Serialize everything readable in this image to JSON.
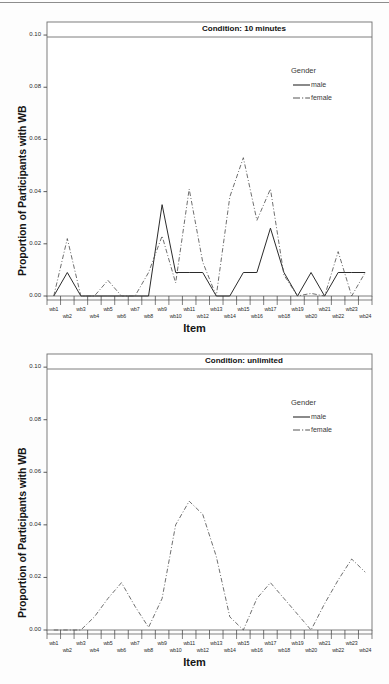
{
  "figure": {
    "ylabel": "Proportion of Participants with WB",
    "xlabel": "Item",
    "ytick_labels": [
      "0.00",
      "0.02",
      "0.04",
      "0.06",
      "0.08",
      "0.10"
    ],
    "categories": [
      "wb1",
      "wb2",
      "wb3",
      "wb4",
      "wb5",
      "wb6",
      "wb7",
      "wb8",
      "wb9",
      "wb10",
      "wb11",
      "wb12",
      "wb13",
      "wb14",
      "wb15",
      "wb16",
      "wb17",
      "wb18",
      "wb19",
      "wb20",
      "wb21",
      "wb22",
      "wb23",
      "wb24"
    ],
    "legend_title": "Gender",
    "legend_male": "male",
    "legend_female": "female",
    "male_color": "#2b2b2b",
    "female_color": "#555555",
    "frame_color": "#6f6f6f"
  },
  "chart_data": [
    {
      "type": "line",
      "title": "Condition: 10 minutes",
      "xlabel": "Item",
      "ylabel": "Proportion of Participants with WB",
      "ylim": [
        0.0,
        0.105
      ],
      "yticks": [
        0.0,
        0.02,
        0.04,
        0.06,
        0.08,
        0.1
      ],
      "grid": false,
      "legend_position": "top-right-inside",
      "legend_title": "Gender",
      "categories": [
        "wb1",
        "wb2",
        "wb3",
        "wb4",
        "wb5",
        "wb6",
        "wb7",
        "wb8",
        "wb9",
        "wb10",
        "wb11",
        "wb12",
        "wb13",
        "wb14",
        "wb15",
        "wb16",
        "wb17",
        "wb18",
        "wb19",
        "wb20",
        "wb21",
        "wb22",
        "wb23",
        "wb24"
      ],
      "series": [
        {
          "name": "male",
          "style": "solid",
          "values": [
            0.0,
            0.009,
            0.0,
            0.0,
            0.0,
            0.0,
            0.0,
            0.0,
            0.035,
            0.009,
            0.009,
            0.009,
            0.0,
            0.0,
            0.009,
            0.009,
            0.026,
            0.009,
            0.0,
            0.009,
            0.0,
            0.009,
            0.009,
            0.009
          ]
        },
        {
          "name": "female",
          "style": "dash-dot",
          "values": [
            0.0,
            0.022,
            0.0,
            0.0,
            0.006,
            0.0,
            0.0,
            0.009,
            0.023,
            0.005,
            0.041,
            0.013,
            0.0,
            0.038,
            0.053,
            0.029,
            0.041,
            0.008,
            0.0,
            0.001,
            0.0,
            0.017,
            0.0,
            0.009
          ]
        }
      ]
    },
    {
      "type": "line",
      "title": "Condition: unlimited",
      "xlabel": "Item",
      "ylabel": "Proportion of Participants with WB",
      "ylim": [
        0.0,
        0.105
      ],
      "yticks": [
        0.0,
        0.02,
        0.04,
        0.06,
        0.08,
        0.1
      ],
      "grid": false,
      "legend_position": "top-right-inside",
      "legend_title": "Gender",
      "categories": [
        "wb1",
        "wb2",
        "wb3",
        "wb4",
        "wb5",
        "wb6",
        "wb7",
        "wb8",
        "wb9",
        "wb10",
        "wb11",
        "wb12",
        "wb13",
        "wb14",
        "wb15",
        "wb16",
        "wb17",
        "wb18",
        "wb19",
        "wb20",
        "wb21",
        "wb22",
        "wb23",
        "wb24"
      ],
      "series": [
        {
          "name": "male",
          "style": "solid",
          "values": [
            0.0,
            0.0,
            0.0,
            0.0,
            0.0,
            0.0,
            0.0,
            0.0,
            0.0,
            0.0,
            0.0,
            0.0,
            0.0,
            0.0,
            0.0,
            0.0,
            0.0,
            0.0,
            0.0,
            0.0,
            0.0,
            0.0,
            0.0,
            0.0
          ]
        },
        {
          "name": "female",
          "style": "dash-dot",
          "values": [
            0.0,
            0.0,
            0.0,
            0.005,
            0.012,
            0.018,
            0.009,
            0.001,
            0.012,
            0.04,
            0.049,
            0.044,
            0.028,
            0.005,
            0.0,
            0.012,
            0.018,
            0.012,
            0.006,
            0.0,
            0.01,
            0.019,
            0.027,
            0.022,
            0.01,
            0.015,
            0.023,
            0.045,
            0.037,
            0.022,
            0.012,
            0.003,
            0.0,
            0.0,
            0.009,
            0.01,
            0.009,
            0.009,
            0.01,
            0.014,
            0.019
          ]
        }
      ],
      "female_values_by_item": [
        0.0,
        0.0,
        0.0,
        0.005,
        0.012,
        0.018,
        0.009,
        0.001,
        0.012,
        0.04,
        0.049,
        0.044,
        0.028,
        0.005,
        0.0,
        0.012,
        0.018,
        0.012,
        0.006,
        0.0,
        0.01,
        0.019,
        0.027,
        0.022
      ]
    }
  ]
}
